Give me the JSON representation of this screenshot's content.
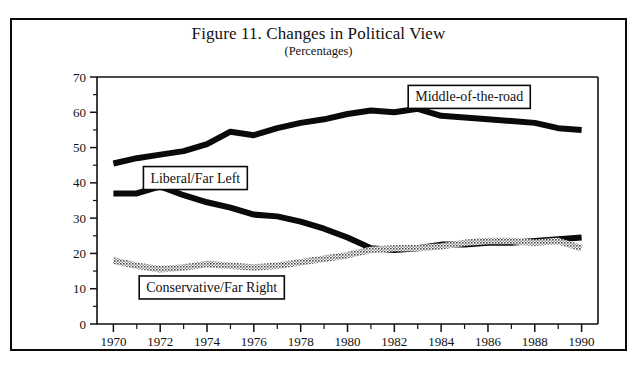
{
  "figure": {
    "title": "Figure 11. Changes in Political View",
    "subtitle": "(Percentages)"
  },
  "chart_data": {
    "type": "line",
    "title": "Figure 11. Changes in Political View",
    "subtitle": "(Percentages)",
    "xlabel": "",
    "ylabel": "",
    "xlim": [
      1969.3,
      1990.7
    ],
    "ylim": [
      0,
      70
    ],
    "yticks": [
      0,
      10,
      20,
      30,
      40,
      50,
      60,
      70
    ],
    "ytick_labels": [
      "0",
      "10",
      "20",
      "30",
      "40",
      "50",
      "60",
      "70"
    ],
    "y_minor_step": 5,
    "xticks": [
      1970,
      1971,
      1972,
      1973,
      1974,
      1975,
      1976,
      1977,
      1978,
      1979,
      1980,
      1981,
      1982,
      1983,
      1984,
      1985,
      1986,
      1987,
      1988,
      1989,
      1990
    ],
    "xtick_labels_shown": [
      "1970",
      "1972",
      "1974",
      "1976",
      "1978",
      "1980",
      "1982",
      "1984",
      "1986",
      "1988",
      "1990"
    ],
    "grid": false,
    "legend_position": "inline-boxed-annotations",
    "x": [
      1970,
      1971,
      1972,
      1973,
      1974,
      1975,
      1976,
      1977,
      1978,
      1979,
      1980,
      1981,
      1982,
      1983,
      1984,
      1985,
      1986,
      1987,
      1988,
      1989,
      1990
    ],
    "series": [
      {
        "name": "Middle-of-the-road",
        "style": "thick-black",
        "color": "#0a0a0a",
        "values": [
          45.5,
          47.0,
          48.0,
          49.0,
          51.0,
          54.5,
          53.5,
          55.5,
          57.0,
          58.0,
          59.5,
          60.5,
          60.0,
          61.0,
          59.0,
          58.5,
          58.0,
          57.5,
          57.0,
          55.5,
          55.0
        ]
      },
      {
        "name": "Liberal/Far Left",
        "style": "thick-black",
        "color": "#0a0a0a",
        "values": [
          37.0,
          37.0,
          39.0,
          36.5,
          34.5,
          33.0,
          31.0,
          30.5,
          29.0,
          27.0,
          24.5,
          21.5,
          21.0,
          21.5,
          22.5,
          22.5,
          23.0,
          23.0,
          23.5,
          24.0,
          24.5
        ]
      },
      {
        "name": "Conservative/Far Right",
        "style": "thick-gray-stipple",
        "color": "#9a9a9a",
        "values": [
          18.0,
          16.5,
          15.5,
          16.0,
          17.0,
          16.5,
          16.0,
          16.5,
          17.5,
          18.5,
          19.5,
          21.0,
          21.5,
          21.5,
          22.0,
          23.0,
          23.5,
          23.5,
          23.0,
          23.5,
          21.5
        ]
      }
    ],
    "annotations": [
      {
        "label": "Middle-of-the-road",
        "x": 1985.2,
        "y": 64.5
      },
      {
        "label": "Liberal/Far Left",
        "x": 1973.5,
        "y": 41.5
      },
      {
        "label": "Conservative/Far Right",
        "x": 1974.2,
        "y": 10.5
      }
    ]
  }
}
